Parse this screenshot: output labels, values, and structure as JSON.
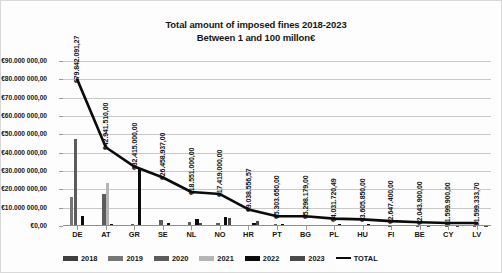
{
  "chart_data": {
    "type": "bar",
    "title": "Total amount of imposed fines 2018-2023",
    "subtitle": "Between 1 and 100 millon€",
    "xlabel": "",
    "ylabel": "",
    "ylim": [
      0,
      90000000
    ],
    "grid": true,
    "legend_position": "bottom",
    "categories": [
      "DE",
      "AT",
      "GR",
      "SE",
      "NL",
      "NO",
      "HR",
      "PT",
      "BG",
      "PL",
      "HU",
      "FI",
      "BE",
      "CY",
      "LV"
    ],
    "ytick_labels": [
      "€0,00",
      "€10.000 000,00",
      "€20.000 000,00",
      "€30.000 000,00",
      "€40.000 000,00",
      "€50.000 000,00",
      "€60.000 000,00",
      "€70.000 000,00",
      "€80.000 000,00",
      "€90.000 000,00"
    ],
    "ytick_values": [
      0,
      10000000,
      20000000,
      30000000,
      40000000,
      50000000,
      60000000,
      70000000,
      80000000,
      90000000
    ],
    "series": [
      {
        "name": "2018",
        "color": "#3f3f3f",
        "values": [
          0,
          0,
          0,
          0,
          0,
          0,
          0,
          0,
          0,
          0,
          0,
          0,
          0,
          0,
          0
        ]
      },
      {
        "name": "2019",
        "color": "#777777",
        "values": [
          16000000,
          0,
          0,
          0,
          0,
          0,
          0,
          0,
          0,
          0,
          0,
          0,
          0,
          0,
          0
        ]
      },
      {
        "name": "2020",
        "color": "#5c5c5c",
        "values": [
          47500000,
          17500000,
          1000000,
          3400000,
          2000000,
          1800000,
          0,
          1300000,
          600000,
          300000,
          400000,
          250000,
          200000,
          150000,
          120000
        ]
      },
      {
        "name": "2021",
        "color": "#b5b5b5",
        "values": [
          0,
          23500000,
          0,
          0,
          0,
          0,
          0,
          0,
          0,
          0,
          0,
          0,
          0,
          0,
          0
        ]
      },
      {
        "name": "2022",
        "color": "#0b0b0b",
        "values": [
          5500000,
          1000000,
          31000000,
          1500000,
          4000000,
          5000000,
          1500000,
          1000000,
          700000,
          1200000,
          900000,
          600000,
          500000,
          450000,
          400000
        ]
      },
      {
        "name": "2023",
        "color": "#4a4a4a",
        "values": [
          0,
          0,
          0,
          500000,
          1500000,
          4500000,
          3000000,
          800000,
          500000,
          400000,
          350000,
          300000,
          250000,
          200000,
          180000
        ]
      }
    ],
    "total_line": {
      "name": "TOTAL",
      "color": "#0b0b0b",
      "values": [
        79842091.27,
        42941510.0,
        32415000.0,
        26458937.0,
        18551000.0,
        17419000.0,
        9038556.57,
        5303650.0,
        5298179.0,
        4031720.49,
        3605850.0,
        2647400.0,
        2043900.0,
        1599900.0,
        1599333.7
      ],
      "labels": [
        "€79.842.091,27",
        "€42.941.510,00",
        "€32.415.000,00",
        "€26.458.937,00",
        "€18.551.000,00",
        "€17.419.000,00",
        "€9.038.556,57",
        "€5.303.650,00",
        "€5.298.179,00",
        "€4.031.720,49",
        "€3.605.850,00",
        "€2.647.400,00",
        "€2.043.900,00",
        "€1.599.900,00",
        "€1.599.333,70"
      ]
    },
    "legend": [
      {
        "label": "2018",
        "color": "#3f3f3f",
        "kind": "bar"
      },
      {
        "label": "2019",
        "color": "#777777",
        "kind": "bar"
      },
      {
        "label": "2020",
        "color": "#5c5c5c",
        "kind": "bar"
      },
      {
        "label": "2021",
        "color": "#b5b5b5",
        "kind": "bar"
      },
      {
        "label": "2022",
        "color": "#0b0b0b",
        "kind": "bar"
      },
      {
        "label": "2023",
        "color": "#4a4a4a",
        "kind": "bar"
      },
      {
        "label": "TOTAL",
        "color": "#0b0b0b",
        "kind": "line"
      }
    ]
  }
}
